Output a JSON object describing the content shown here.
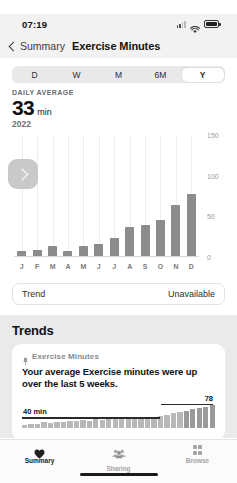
{
  "ghost_text": "",
  "status_bar": {
    "time": "07:19",
    "icons": [
      "cellular-signal-icon",
      "wifi-icon",
      "battery-icon"
    ]
  },
  "nav_bar": {
    "back_label": "Summary",
    "back_icon": "chevron-left-icon",
    "title": "Exercise Minutes"
  },
  "segmented_control": {
    "options": [
      "D",
      "W",
      "M",
      "6M",
      "Y"
    ],
    "selected": "Y"
  },
  "headline": {
    "label": "DAILY AVERAGE",
    "value": "33",
    "unit": "min",
    "year": "2022"
  },
  "chart_scroll_button": {
    "icon": "chevron-right-icon"
  },
  "trend_row": {
    "label": "Trend",
    "value": "Unavailable"
  },
  "trends": {
    "section_title": "Trends",
    "card": {
      "pin_icon": "pin-icon",
      "metric": "Exercise Minutes",
      "headline": "Your average Exercise minutes were up over the last 5 weeks.",
      "average_label": "40 min",
      "recent_label": "78"
    }
  },
  "tab_bar": {
    "tabs": [
      {
        "label": "Summary",
        "icon": "heart-icon",
        "active": true
      },
      {
        "label": "Sharing",
        "icon": "people-icon",
        "active": false
      },
      {
        "label": "Browse",
        "icon": "grid-icon",
        "active": false
      }
    ]
  },
  "colors": {
    "bar": "#8c8c8c",
    "grid": "#ededed",
    "segment_track": "#e9e9ea",
    "section_bg": "#eaeaea",
    "text_primary": "#111111",
    "text_secondary": "#7a7a7a"
  },
  "chart_data": {
    "type": "bar",
    "title": "Exercise Minutes",
    "subtitle": "DAILY AVERAGE 33 min",
    "xlabel": "",
    "ylabel": "",
    "categories": [
      "J",
      "F",
      "M",
      "A",
      "M",
      "J",
      "J",
      "A",
      "S",
      "O",
      "N",
      "D"
    ],
    "category_full": [
      "January",
      "February",
      "March",
      "April",
      "May",
      "June",
      "July",
      "August",
      "September",
      "October",
      "November",
      "December"
    ],
    "values": [
      7,
      9,
      13,
      8,
      13,
      16,
      23,
      37,
      39,
      46,
      64,
      78
    ],
    "ylim": [
      0,
      150
    ],
    "yticks": [
      0,
      50,
      100,
      150
    ],
    "ytick_labels": [
      "0",
      "50",
      "100",
      "150"
    ],
    "grid": true,
    "legend": false,
    "year": "2022",
    "average": 33,
    "unit": "min"
  },
  "mini_chart_data": {
    "type": "bar",
    "title": "Exercise Minutes trend",
    "values": [
      4,
      6,
      5,
      8,
      7,
      9,
      8,
      11,
      10,
      12,
      11,
      13,
      12,
      14,
      13,
      15,
      14,
      16,
      15,
      17,
      16,
      18,
      20,
      22,
      24,
      26,
      28,
      30,
      32,
      34
    ],
    "average_line": 40,
    "average_line_label": "40 min",
    "recent_line": 78,
    "recent_line_label": "78",
    "recent_count": 5,
    "grid": false,
    "legend": false
  }
}
